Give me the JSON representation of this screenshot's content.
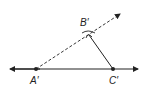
{
  "diagram": {
    "type": "geometric-construction",
    "points": [
      {
        "id": "A",
        "label": "A′",
        "x": 36,
        "y": 69
      },
      {
        "id": "B",
        "label": "B′",
        "x": 89,
        "y": 35
      },
      {
        "id": "C",
        "label": "C′",
        "x": 113,
        "y": 69
      }
    ],
    "elements": [
      {
        "kind": "line",
        "style": "solid",
        "through": [
          "A",
          "C"
        ],
        "arrows": "both"
      },
      {
        "kind": "ray",
        "style": "dashed",
        "from": "A",
        "through": "B",
        "arrows": "end"
      },
      {
        "kind": "segment",
        "style": "solid",
        "from": "C",
        "to": "B"
      },
      {
        "kind": "arc-marks",
        "at": "B",
        "count": 2
      }
    ],
    "colors": {
      "stroke": "#222222",
      "background": "#ffffff"
    }
  }
}
